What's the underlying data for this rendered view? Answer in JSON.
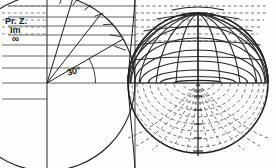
{
  "figure": {
    "width": 276,
    "height": 168,
    "background": "#fdfdfc",
    "ink_color": "#1a1a1a",
    "grid_color": "#4d4d4d",
    "dash_color": "#5a5a5a"
  },
  "labels": {
    "plane_label": "Pr. Z.",
    "imag_axis_label": "Im",
    "infinity_label": "∞",
    "angle_label": "30°"
  },
  "left_plane": {
    "origin": {
      "x": 47,
      "y": 83
    },
    "vertical_axis_x": 47,
    "horizontal_gridline_y": [
      6,
      17,
      26,
      35,
      45,
      56,
      68,
      83,
      99
    ],
    "radial_circle_radius": 88,
    "arc_tick_count": 7,
    "rays_deg": [
      30,
      52,
      72
    ],
    "angle_marked_deg": 30
  },
  "sphere": {
    "center": {
      "x": 198,
      "y": 83
    },
    "radius": 70,
    "equator_y": 83,
    "parallels_top_y": [
      14,
      26,
      38,
      50,
      62,
      72
    ],
    "parallels_bottom_count": 9,
    "meridian_count": 11,
    "top_half_style": "solid",
    "bottom_half_style": "dashed"
  },
  "projection_lines": {
    "style": "dashed",
    "y_values": [
      6,
      13,
      20,
      27,
      34,
      41
    ],
    "x_start": 135,
    "x_end": 266
  },
  "tangent_line_x": 135
}
